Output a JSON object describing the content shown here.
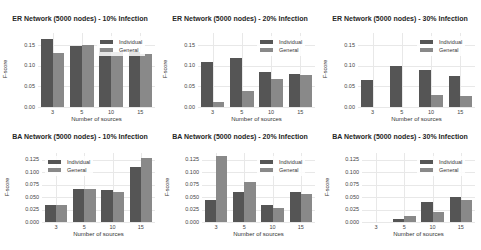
{
  "chart_data": [
    {
      "type": "bar",
      "title": "ER Network (5000 nodes) - 10% Infection",
      "xlabel": "Number of sources",
      "ylabel": "F-score",
      "categories": [
        "3",
        "5",
        "10",
        "15"
      ],
      "yticks": [
        "0.00",
        "0.05",
        "0.10",
        "0.15"
      ],
      "ylim": [
        0,
        0.18
      ],
      "grid": true,
      "legend_position": "upper right",
      "series": [
        {
          "name": "Individual",
          "values": [
            0.165,
            0.148,
            0.143,
            0.135
          ]
        },
        {
          "name": "General",
          "values": [
            0.132,
            0.15,
            0.135,
            0.13
          ]
        }
      ]
    },
    {
      "type": "bar",
      "title": "ER Network (5000 nodes) - 20% Infection",
      "xlabel": "Number of sources",
      "ylabel": "F-score",
      "categories": [
        "3",
        "5",
        "10",
        "15"
      ],
      "yticks": [
        "0.00",
        "0.05",
        "0.10",
        "0.15"
      ],
      "ylim": [
        0,
        0.18
      ],
      "grid": true,
      "legend_position": "upper right",
      "series": [
        {
          "name": "Individual",
          "values": [
            0.11,
            0.12,
            0.086,
            0.081
          ]
        },
        {
          "name": "General",
          "values": [
            0.012,
            0.039,
            0.069,
            0.079
          ]
        }
      ]
    },
    {
      "type": "bar",
      "title": "ER Network (5000 nodes) - 30% Infection",
      "xlabel": "Number of sources",
      "ylabel": "F-score",
      "categories": [
        "3",
        "5",
        "10",
        "15"
      ],
      "yticks": [
        "0.00",
        "0.05",
        "0.10",
        "0.15"
      ],
      "ylim": [
        0,
        0.18
      ],
      "grid": true,
      "legend_position": "upper right",
      "series": [
        {
          "name": "Individual",
          "values": [
            0.066,
            0.1,
            0.089,
            0.076
          ]
        },
        {
          "name": "General",
          "values": [
            0.0,
            0.0,
            0.03,
            0.027
          ]
        }
      ]
    },
    {
      "type": "bar",
      "title": "BA Network (5000 nodes) - 10% Infection",
      "xlabel": "Number of sources",
      "ylabel": "F-score",
      "categories": [
        "3",
        "5",
        "10",
        "15"
      ],
      "yticks": [
        "0.000",
        "0.025",
        "0.050",
        "0.075",
        "0.100",
        "0.125"
      ],
      "ylim": [
        0,
        0.138
      ],
      "grid": true,
      "legend_position": "upper left",
      "series": [
        {
          "name": "Individual",
          "values": [
            0.034,
            0.067,
            0.065,
            0.111
          ]
        },
        {
          "name": "General",
          "values": [
            0.034,
            0.067,
            0.061,
            0.129
          ]
        }
      ]
    },
    {
      "type": "bar",
      "title": "BA Network (5000 nodes) - 20% Infection",
      "xlabel": "Number of sources",
      "ylabel": "F-score",
      "categories": [
        "3",
        "5",
        "10",
        "15"
      ],
      "yticks": [
        "0.000",
        "0.025",
        "0.050",
        "0.075",
        "0.100",
        "0.125"
      ],
      "ylim": [
        0,
        0.138
      ],
      "grid": true,
      "legend_position": "upper right",
      "series": [
        {
          "name": "Individual",
          "values": [
            0.044,
            0.061,
            0.034,
            0.061
          ]
        },
        {
          "name": "General",
          "values": [
            0.133,
            0.08,
            0.028,
            0.057
          ]
        }
      ]
    },
    {
      "type": "bar",
      "title": "BA Network (5000 nodes) - 30% Infection",
      "xlabel": "Number of sources",
      "ylabel": "F-score",
      "categories": [
        "3",
        "5",
        "10",
        "15"
      ],
      "yticks": [
        "0.000",
        "0.025",
        "0.050",
        "0.075",
        "0.100",
        "0.125"
      ],
      "ylim": [
        0,
        0.138
      ],
      "grid": true,
      "legend_position": "upper right",
      "series": [
        {
          "name": "Individual",
          "values": [
            0.0,
            0.006,
            0.041,
            0.05
          ]
        },
        {
          "name": "General",
          "values": [
            0.0,
            0.013,
            0.02,
            0.045
          ]
        }
      ]
    }
  ],
  "colors": {
    "individual": "#555555",
    "general": "#898989",
    "grid": "#e8e8e8"
  }
}
